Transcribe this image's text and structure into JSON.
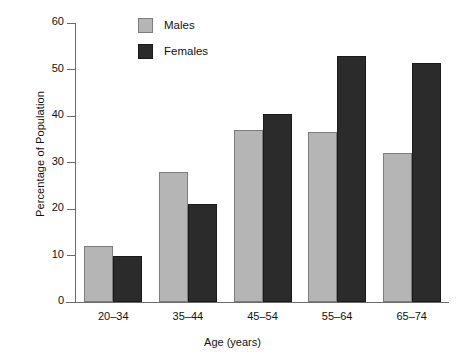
{
  "chart_data": {
    "type": "bar",
    "title": "",
    "subtitle": "",
    "xlabel": "Age (years)",
    "ylabel": "Percentage of Population",
    "categories": [
      "20–34",
      "35–44",
      "45–54",
      "55–64",
      "65–74"
    ],
    "series": [
      {
        "name": "Males",
        "color": "#b5b5b5",
        "values": [
          12,
          28,
          37,
          36.5,
          32
        ]
      },
      {
        "name": "Females",
        "color": "#2b2b2b",
        "values": [
          10,
          21,
          40.5,
          53,
          51.5
        ]
      }
    ],
    "ylim": [
      0,
      60
    ],
    "yticks": [
      0,
      10,
      20,
      30,
      40,
      50,
      60
    ],
    "ytick_labels": [
      "0",
      "10",
      "20",
      "30",
      "40",
      "50",
      "60"
    ],
    "grid": false,
    "legend_position": "top-center-left",
    "legend": [
      "Males",
      "Females"
    ]
  },
  "axes": {
    "y_title": "Percentage of Population",
    "x_title": "Age (years)"
  },
  "legend": {
    "entries": [
      {
        "label": "Males"
      },
      {
        "label": "Females"
      }
    ]
  }
}
